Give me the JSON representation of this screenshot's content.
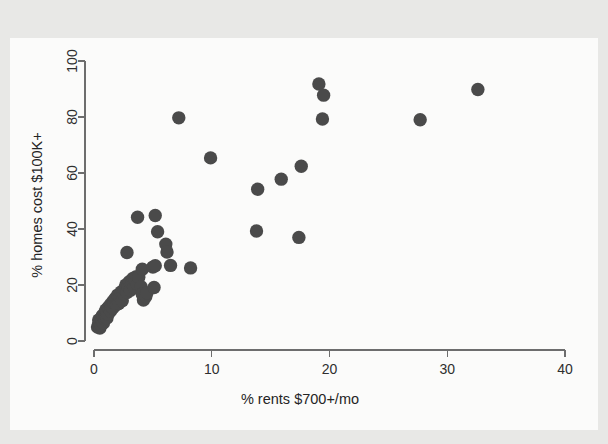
{
  "chart_data": {
    "type": "scatter",
    "title": "",
    "xlabel": "% rents $700+/mo",
    "ylabel": "% homes cost $100K+",
    "xlim": [
      0,
      40
    ],
    "ylim": [
      0,
      100
    ],
    "xticks": [
      0,
      10,
      20,
      30,
      40
    ],
    "yticks": [
      0,
      20,
      40,
      60,
      80,
      100
    ],
    "xtick_labels": [
      "0",
      "10",
      "20",
      "30",
      "40"
    ],
    "ytick_labels": [
      "0",
      "20",
      "40",
      "60",
      "80",
      "100"
    ],
    "grid": false,
    "legend": null,
    "marker": "filled-circle",
    "marker_color": "#4a4a4a",
    "marker_size": 9,
    "series": [
      {
        "name": "states",
        "points": [
          [
            0.3,
            5.0
          ],
          [
            0.4,
            6.1
          ],
          [
            0.4,
            7.5
          ],
          [
            0.5,
            4.6
          ],
          [
            0.5,
            6.8
          ],
          [
            0.6,
            8.0
          ],
          [
            0.6,
            5.7
          ],
          [
            0.7,
            9.0
          ],
          [
            0.7,
            7.1
          ],
          [
            0.8,
            6.4
          ],
          [
            0.8,
            8.6
          ],
          [
            0.9,
            10.0
          ],
          [
            0.9,
            7.9
          ],
          [
            1.0,
            9.3
          ],
          [
            1.0,
            11.1
          ],
          [
            1.1,
            8.2
          ],
          [
            1.1,
            10.4
          ],
          [
            1.2,
            12.0
          ],
          [
            1.2,
            9.6
          ],
          [
            1.3,
            11.4
          ],
          [
            1.4,
            13.0
          ],
          [
            1.4,
            10.7
          ],
          [
            1.5,
            12.5
          ],
          [
            1.6,
            14.1
          ],
          [
            1.6,
            11.8
          ],
          [
            1.7,
            13.6
          ],
          [
            1.8,
            15.2
          ],
          [
            1.9,
            12.9
          ],
          [
            2.0,
            14.7
          ],
          [
            2.0,
            16.4
          ],
          [
            2.1,
            13.4
          ],
          [
            2.2,
            15.9
          ],
          [
            2.3,
            17.5
          ],
          [
            2.4,
            14.4
          ],
          [
            2.5,
            16.9
          ],
          [
            2.6,
            18.6
          ],
          [
            2.7,
            20.0
          ],
          [
            2.8,
            17.3
          ],
          [
            2.9,
            19.5
          ],
          [
            3.0,
            21.2
          ],
          [
            3.1,
            18.1
          ],
          [
            3.2,
            20.6
          ],
          [
            3.3,
            22.3
          ],
          [
            3.4,
            19.1
          ],
          [
            3.5,
            21.8
          ],
          [
            3.6,
            23.0
          ],
          [
            3.7,
            20.2
          ],
          [
            3.8,
            22.8
          ],
          [
            4.0,
            19.4
          ],
          [
            4.1,
            16.8
          ],
          [
            4.2,
            14.6
          ],
          [
            4.4,
            15.9
          ],
          [
            4.5,
            17.2
          ],
          [
            2.8,
            31.6
          ],
          [
            3.7,
            44.2
          ],
          [
            4.1,
            25.6
          ],
          [
            5.0,
            26.4
          ],
          [
            5.2,
            26.9
          ],
          [
            5.2,
            44.8
          ],
          [
            5.4,
            39.0
          ],
          [
            5.1,
            19.1
          ],
          [
            6.1,
            34.6
          ],
          [
            6.2,
            31.8
          ],
          [
            6.5,
            27.0
          ],
          [
            8.2,
            26.1
          ],
          [
            7.2,
            79.7
          ],
          [
            9.9,
            65.4
          ],
          [
            13.8,
            39.3
          ],
          [
            13.9,
            54.2
          ],
          [
            15.9,
            57.8
          ],
          [
            17.4,
            37.0
          ],
          [
            17.6,
            62.4
          ],
          [
            19.1,
            91.8
          ],
          [
            19.5,
            87.8
          ],
          [
            19.4,
            79.3
          ],
          [
            27.7,
            79.0
          ],
          [
            32.6,
            89.8
          ]
        ]
      }
    ]
  },
  "figure": {
    "background_color": "#e8e8e6",
    "paper_color": "#fbfbfa",
    "axis_color": "#6d6d6d",
    "text_color": "#2f2f2f"
  }
}
